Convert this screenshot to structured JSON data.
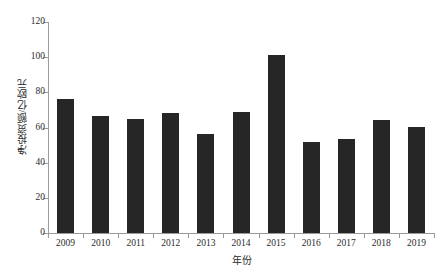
{
  "chart_data": {
    "type": "bar",
    "title": "",
    "subtitle": "",
    "xlabel": "年份",
    "ylabel": "净投资额/亿欧元",
    "categories": [
      "2009",
      "2010",
      "2011",
      "2012",
      "2013",
      "2014",
      "2015",
      "2016",
      "2017",
      "2018",
      "2019"
    ],
    "values": [
      76,
      66.5,
      65,
      68,
      56.5,
      69,
      101,
      52,
      53.5,
      64.5,
      60.5
    ],
    "series": [
      {
        "name": "净投资额",
        "values": [
          76,
          66.5,
          65,
          68,
          56.5,
          69,
          101,
          52,
          53.5,
          64.5,
          60.5
        ]
      }
    ],
    "ylim": [
      0,
      120
    ],
    "ytick_values": [
      0,
      20,
      40,
      60,
      80,
      100,
      120
    ],
    "ytick_labels": [
      "0",
      "20",
      "40",
      "60",
      "80",
      "100",
      "120"
    ],
    "grid": false,
    "legend": false,
    "legend_position": "none",
    "bar_color": "#262626",
    "axis_color": "#9a9a9a",
    "text_color": "#2b2b2b",
    "background_color": "#ffffff"
  }
}
